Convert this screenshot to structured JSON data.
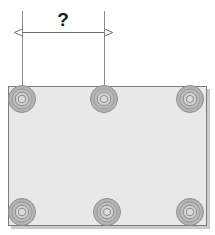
{
  "drawing": {
    "kind": "engineering-dimension-drawing",
    "subject": "rectangular mounting plate with six countersunk bolt holes",
    "background_color": "#ffffff"
  },
  "dimension": {
    "label": "?",
    "label_x": 63,
    "label_y": 26,
    "line_y": 32,
    "start_x": 22,
    "end_x": 104,
    "arrow_style": "double-headed",
    "line_color": "#6b6b6b",
    "extension_line_color": "#8a8a8a",
    "extension_top_y": 11,
    "extension_bottom_y": 100,
    "measures_from": "hole-top-left",
    "measures_to": "hole-top-center"
  },
  "plate": {
    "x": 8,
    "y": 86,
    "width": 199,
    "height": 140,
    "fill_color": "#e8e8e6",
    "stroke_color": "#7d7d7d",
    "shadow_color": "#c9c9c9",
    "shadow_offset": 3
  },
  "holes": [
    {
      "name": "hole-top-left",
      "cx": 22,
      "cy": 99,
      "r_outer": 14,
      "r_mid": 10,
      "r_inner": 7,
      "r_core": 4
    },
    {
      "name": "hole-top-center",
      "cx": 104,
      "cy": 99,
      "r_outer": 14,
      "r_mid": 10,
      "r_inner": 7,
      "r_core": 4
    },
    {
      "name": "hole-top-right",
      "cx": 190,
      "cy": 99,
      "r_outer": 14,
      "r_mid": 10,
      "r_inner": 7,
      "r_core": 4
    },
    {
      "name": "hole-bottom-left",
      "cx": 22,
      "cy": 212,
      "r_outer": 14,
      "r_mid": 10,
      "r_inner": 7,
      "r_core": 4
    },
    {
      "name": "hole-bottom-center",
      "cx": 107,
      "cy": 212,
      "r_outer": 14,
      "r_mid": 10,
      "r_inner": 7,
      "r_core": 4
    },
    {
      "name": "hole-bottom-right",
      "cx": 190,
      "cy": 212,
      "r_outer": 14,
      "r_mid": 10,
      "r_inner": 7,
      "r_core": 4
    }
  ],
  "hole_colors": {
    "ring_outer_fill": "#b3b3b3",
    "ring_outer_stroke": "#8f8f8f",
    "ring_mid_fill": "#bdbdbd",
    "ring_mid_stroke": "#9a9a9a",
    "ring_inner_fill": "#d2d2d0",
    "ring_inner_stroke": "#8a8a8a",
    "core_fill": "#dcdcda",
    "core_stroke": "#8a8a8a"
  }
}
